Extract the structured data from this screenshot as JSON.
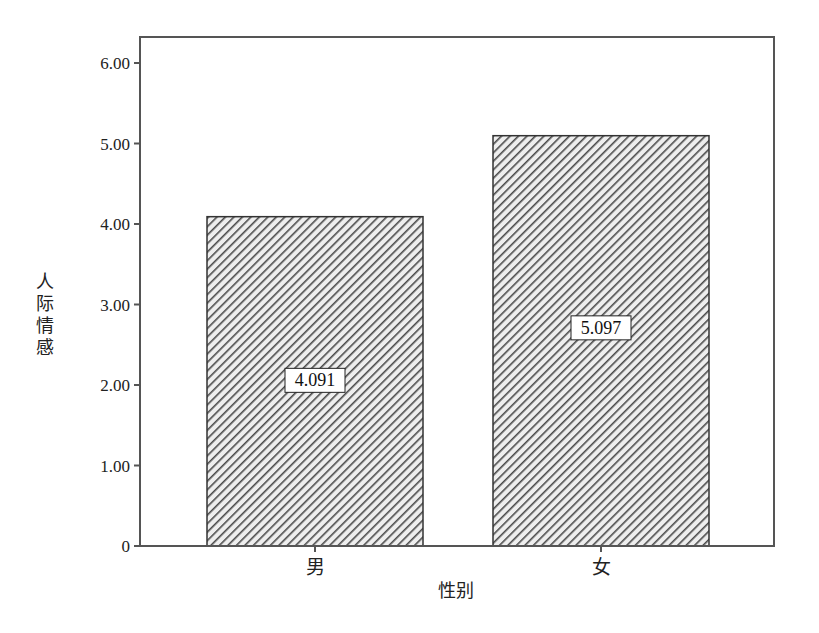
{
  "chart_data": {
    "type": "bar",
    "title": "",
    "xlabel": "性别",
    "ylabel": "人际情感",
    "categories": [
      "男",
      "女"
    ],
    "values": [
      4.091,
      5.097
    ],
    "value_labels": [
      "4.091",
      "5.097"
    ],
    "ylim": [
      0,
      6.3
    ],
    "yticks": [
      0,
      1,
      2,
      3,
      4,
      5,
      6
    ],
    "ytick_labels": [
      "0",
      "1.00",
      "2.00",
      "3.00",
      "4.00",
      "5.00",
      "6.00"
    ],
    "grid": false,
    "legend": null,
    "bar_fill": "diagonal-hatch",
    "colors": {
      "hatch": "#555555",
      "bar_border": "#333333",
      "frame": "#555555",
      "background": "#ffffff"
    }
  }
}
